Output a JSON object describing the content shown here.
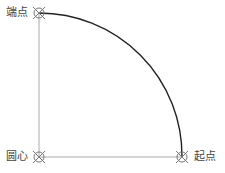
{
  "diagram": {
    "type": "arc-construction",
    "points": {
      "end": {
        "label": "端点",
        "x": 39,
        "y": 13
      },
      "center": {
        "label": "圆心",
        "x": 39,
        "y": 157
      },
      "start": {
        "label": "起点",
        "x": 182,
        "y": 157
      }
    },
    "radius": 143,
    "colors": {
      "arc": "#222222",
      "guide": "#aaaaaa",
      "marker": "#777777",
      "label": "#444444"
    }
  }
}
